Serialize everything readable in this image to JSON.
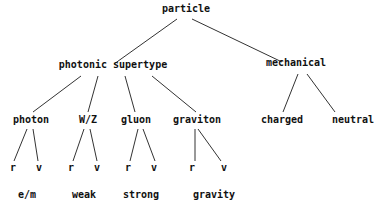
{
  "diagram": {
    "type": "tree",
    "nodes": {
      "root": {
        "label": "particle",
        "x": 186,
        "y": 9
      },
      "photonic": {
        "label": "photonic supertype",
        "x": 113,
        "y": 65
      },
      "mechanical": {
        "label": "mechanical",
        "x": 296,
        "y": 63
      },
      "photon": {
        "label": "photon",
        "x": 31,
        "y": 120
      },
      "wz": {
        "label": "W/Z",
        "x": 88,
        "y": 120
      },
      "gluon": {
        "label": "gluon",
        "x": 136,
        "y": 120
      },
      "graviton": {
        "label": "graviton",
        "x": 197,
        "y": 120
      },
      "charged": {
        "label": "charged",
        "x": 282,
        "y": 120
      },
      "neutral": {
        "label": "neutral",
        "x": 353,
        "y": 120
      },
      "photon_r": {
        "label": "r",
        "x": 13,
        "y": 168
      },
      "photon_v": {
        "label": "v",
        "x": 39,
        "y": 168
      },
      "wz_r": {
        "label": "r",
        "x": 71,
        "y": 168
      },
      "wz_v": {
        "label": "v",
        "x": 97,
        "y": 168
      },
      "gluon_r": {
        "label": "r",
        "x": 128,
        "y": 168
      },
      "gluon_v": {
        "label": "v",
        "x": 154,
        "y": 168
      },
      "graviton_r": {
        "label": "r",
        "x": 192,
        "y": 168
      },
      "graviton_v": {
        "label": "v",
        "x": 224,
        "y": 168
      },
      "em": {
        "label": "e/m",
        "x": 27,
        "y": 195
      },
      "weak": {
        "label": "weak",
        "x": 84,
        "y": 195
      },
      "strong": {
        "label": "strong",
        "x": 141,
        "y": 195
      },
      "gravity": {
        "label": "gravity",
        "x": 214,
        "y": 195
      }
    },
    "edges": [
      {
        "x1": 177,
        "y1": 19,
        "x2": 114,
        "y2": 64
      },
      {
        "x1": 192,
        "y1": 19,
        "x2": 282,
        "y2": 62
      },
      {
        "x1": 81,
        "y1": 76,
        "x2": 33,
        "y2": 112
      },
      {
        "x1": 98,
        "y1": 76,
        "x2": 88,
        "y2": 112
      },
      {
        "x1": 125,
        "y1": 76,
        "x2": 135,
        "y2": 112
      },
      {
        "x1": 152,
        "y1": 76,
        "x2": 196,
        "y2": 112
      },
      {
        "x1": 298,
        "y1": 74,
        "x2": 283,
        "y2": 112
      },
      {
        "x1": 307,
        "y1": 74,
        "x2": 335,
        "y2": 112
      },
      {
        "x1": 27,
        "y1": 129,
        "x2": 14,
        "y2": 161
      },
      {
        "x1": 33,
        "y1": 129,
        "x2": 38,
        "y2": 161
      },
      {
        "x1": 84,
        "y1": 129,
        "x2": 73,
        "y2": 161
      },
      {
        "x1": 90,
        "y1": 129,
        "x2": 97,
        "y2": 161
      },
      {
        "x1": 138,
        "y1": 129,
        "x2": 130,
        "y2": 161
      },
      {
        "x1": 143,
        "y1": 129,
        "x2": 155,
        "y2": 161
      },
      {
        "x1": 195,
        "y1": 129,
        "x2": 195,
        "y2": 161
      },
      {
        "x1": 198,
        "y1": 129,
        "x2": 221,
        "y2": 161
      }
    ],
    "line_color": "#333333",
    "text_color": "#111111"
  }
}
